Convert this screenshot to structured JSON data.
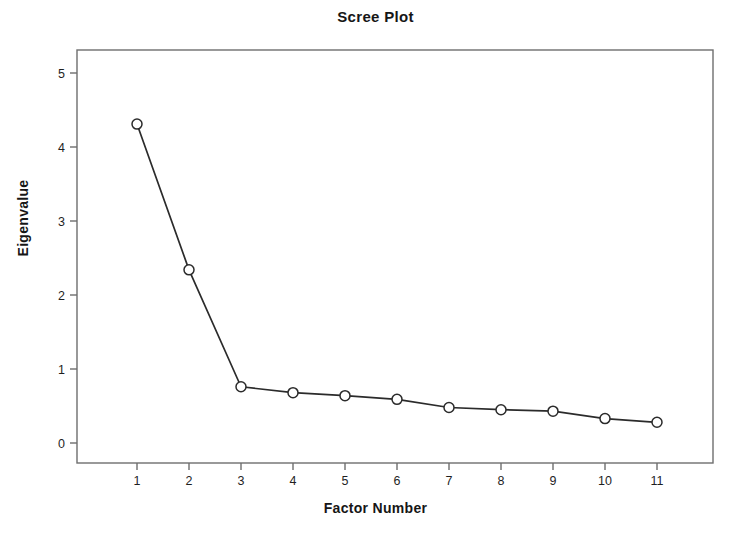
{
  "chart_data": {
    "type": "line",
    "title": "Scree Plot",
    "xlabel": "Factor Number",
    "ylabel": "Eigenvalue",
    "x": [
      1,
      2,
      3,
      4,
      5,
      6,
      7,
      8,
      9,
      10,
      11
    ],
    "values": [
      4.31,
      2.34,
      0.76,
      0.68,
      0.64,
      0.59,
      0.48,
      0.45,
      0.43,
      0.33,
      0.28
    ],
    "xticklabels": [
      "1",
      "2",
      "3",
      "4",
      "5",
      "6",
      "7",
      "8",
      "9",
      "10",
      "11"
    ],
    "yticklabels": [
      "0",
      "1",
      "2",
      "3",
      "4",
      "5"
    ],
    "yticks": [
      0,
      1,
      2,
      3,
      4,
      5
    ],
    "xlim": [
      0.55,
      11.45
    ],
    "ylim": [
      -0.1,
      5.25
    ],
    "grid": false,
    "legend": false,
    "marker": "open-circle",
    "line_color": "#2b2b2b",
    "marker_color": "#2b2b2b",
    "axis_color": "#6e6e6e",
    "background_color": "#ffffff",
    "series": [
      {
        "name": "Eigenvalue",
        "values": [
          4.31,
          2.34,
          0.76,
          0.68,
          0.64,
          0.59,
          0.48,
          0.45,
          0.43,
          0.33,
          0.28
        ]
      }
    ]
  },
  "figure": {
    "title": "Scree Plot",
    "xlabel": "Factor Number",
    "ylabel": "Eigenvalue"
  }
}
